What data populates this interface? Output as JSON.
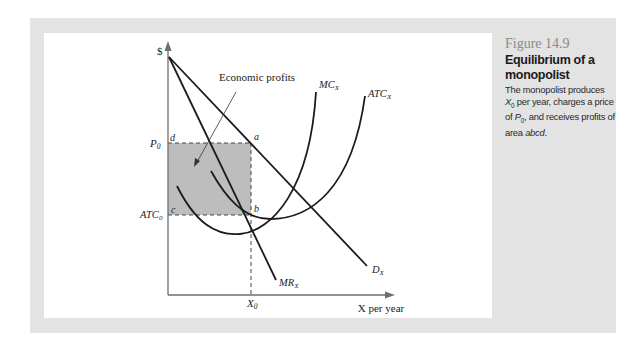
{
  "figure": {
    "number": "Figure 14.9",
    "title": "Equilibrium of a monopolist",
    "caption": {
      "part1": "The monopolist produces ",
      "x_var": "X",
      "x_sub": "0",
      "part2": " per year, charges a price of ",
      "p_var": "P",
      "p_sub": "0",
      "part3": ", and receives profits of area ",
      "area": "abcd",
      "part4": "."
    }
  },
  "diagram": {
    "y_axis_label": "$",
    "x_axis_label": "X per year",
    "annotation": "Economic profits",
    "axis_ticks": {
      "p0": {
        "main": "P",
        "sub": "0"
      },
      "atc0": {
        "main": "ATC",
        "sub": "0"
      },
      "x0": {
        "main": "X",
        "sub": "0"
      }
    },
    "points": {
      "a": "a",
      "b": "b",
      "c": "c",
      "d": "d"
    },
    "curves": {
      "mc": {
        "main": "MC",
        "sub": "X"
      },
      "atc": {
        "main": "ATC",
        "sub": "X"
      },
      "demand": {
        "main": "D",
        "sub": "X"
      },
      "mr": {
        "main": "MR",
        "sub": "X"
      }
    },
    "colors": {
      "profit_area": "#bdbdbd",
      "curve": "#1c1c1c",
      "axis": "#6e6e6e",
      "panel": "#e3e3e3"
    }
  }
}
